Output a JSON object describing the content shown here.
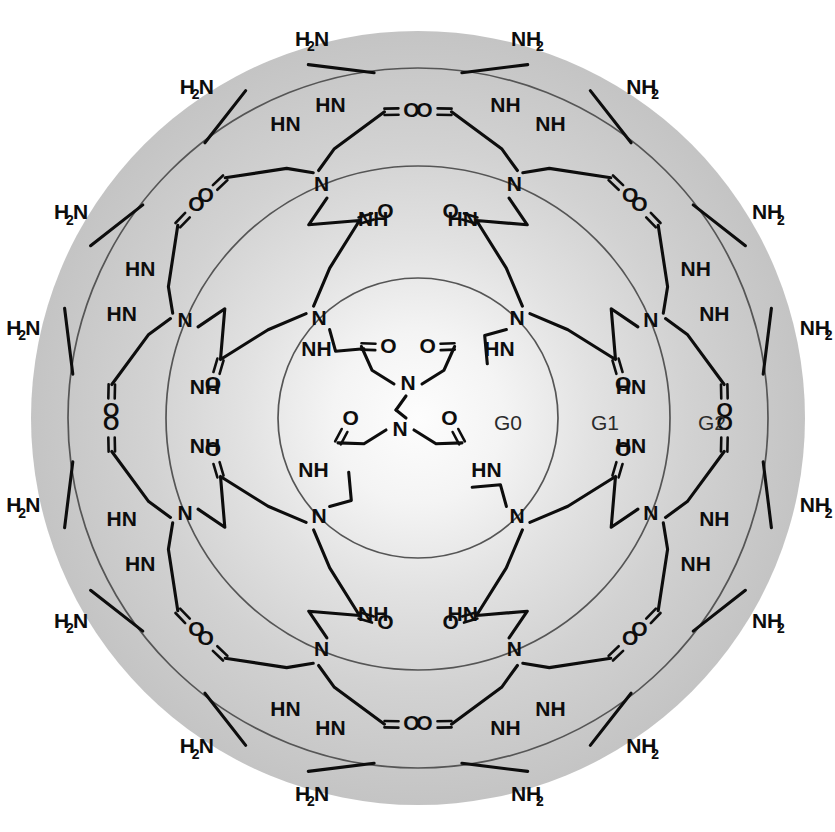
{
  "figure": {
    "molecule_name": "poly(amidoamine) dendrimer",
    "core_type": "ethylenediamine",
    "generations_shown": 3,
    "terminal_group_count": 16,
    "background": {
      "disk_center_color": "#fdfdfd",
      "disk_edge_color": "#c6c6c6",
      "page_color": "#ffffff",
      "circle_stroke": "#555555",
      "bond_color": "#0d0d0d"
    },
    "geometry": {
      "center_x": 418,
      "center_y": 418,
      "disk_radius": 387,
      "g0_radius": 140,
      "g1_radius": 252,
      "g2_radius": 350
    }
  },
  "generation_labels": [
    {
      "id": "G0",
      "text": "G0",
      "x": 508,
      "y": 424
    },
    {
      "id": "G1",
      "text": "G1",
      "x": 605,
      "y": 424
    },
    {
      "id": "G2",
      "text": "G2",
      "x": 712,
      "y": 424
    }
  ],
  "atoms": {
    "nitrogen": "N",
    "oxygen": "O",
    "amide_nh": "NH",
    "amide_hn": "HN",
    "amine": "NH",
    "amine_sub": "2",
    "amine_left": "N",
    "amine_left_prefix": "H",
    "amine_left_sub": "2",
    "hydrogen": "H"
  },
  "labels": {
    "NH2_right": "NH",
    "NH2_left": "N",
    "H2_prefix": "H",
    "sub2": "2",
    "NH": "NH",
    "HN": "HN",
    "N": "N",
    "O": "O",
    "H": "H"
  },
  "chart_data": {
    "type": "diagram",
    "categories": [
      "G0",
      "G1",
      "G2"
    ],
    "values": [
      4,
      8,
      16
    ],
    "series": [
      {
        "name": "branch points / terminal groups per generation",
        "values": [
          4,
          8,
          16
        ]
      }
    ],
    "annotations": [
      "G0",
      "G1",
      "G2"
    ],
    "xlabel": "generation",
    "ylabel": "number of arms"
  }
}
